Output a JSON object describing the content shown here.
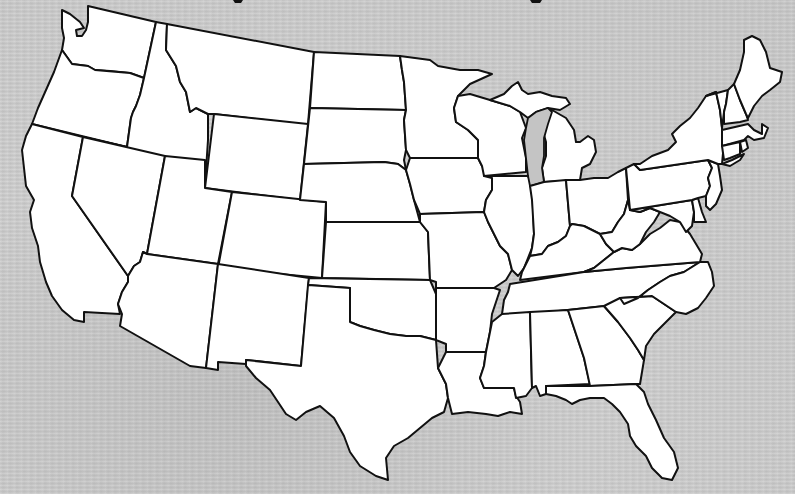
{
  "map": {
    "type": "outline",
    "subject": "Contiguous United States",
    "labels_visible": false,
    "colors": {
      "background": "#cbcbcb",
      "state_fill": "#ffffff",
      "border": "#111111",
      "lake": "#c4c4c4"
    },
    "states": [
      {
        "id": "WA",
        "name": "Washington"
      },
      {
        "id": "OR",
        "name": "Oregon"
      },
      {
        "id": "CA",
        "name": "California"
      },
      {
        "id": "ID",
        "name": "Idaho"
      },
      {
        "id": "NV",
        "name": "Nevada"
      },
      {
        "id": "MT",
        "name": "Montana"
      },
      {
        "id": "WY",
        "name": "Wyoming"
      },
      {
        "id": "UT",
        "name": "Utah"
      },
      {
        "id": "AZ",
        "name": "Arizona"
      },
      {
        "id": "CO",
        "name": "Colorado"
      },
      {
        "id": "NM",
        "name": "New Mexico"
      },
      {
        "id": "ND",
        "name": "North Dakota"
      },
      {
        "id": "SD",
        "name": "South Dakota"
      },
      {
        "id": "NE",
        "name": "Nebraska"
      },
      {
        "id": "KS",
        "name": "Kansas"
      },
      {
        "id": "OK",
        "name": "Oklahoma"
      },
      {
        "id": "TX",
        "name": "Texas"
      },
      {
        "id": "MN",
        "name": "Minnesota"
      },
      {
        "id": "IA",
        "name": "Iowa"
      },
      {
        "id": "MO",
        "name": "Missouri"
      },
      {
        "id": "AR",
        "name": "Arkansas"
      },
      {
        "id": "LA",
        "name": "Louisiana"
      },
      {
        "id": "WI",
        "name": "Wisconsin"
      },
      {
        "id": "IL",
        "name": "Illinois"
      },
      {
        "id": "MI",
        "name": "Michigan"
      },
      {
        "id": "IN",
        "name": "Indiana"
      },
      {
        "id": "OH",
        "name": "Ohio"
      },
      {
        "id": "KY",
        "name": "Kentucky"
      },
      {
        "id": "TN",
        "name": "Tennessee"
      },
      {
        "id": "MS",
        "name": "Mississippi"
      },
      {
        "id": "AL",
        "name": "Alabama"
      },
      {
        "id": "GA",
        "name": "Georgia"
      },
      {
        "id": "FL",
        "name": "Florida"
      },
      {
        "id": "SC",
        "name": "South Carolina"
      },
      {
        "id": "NC",
        "name": "North Carolina"
      },
      {
        "id": "VA",
        "name": "Virginia"
      },
      {
        "id": "WV",
        "name": "West Virginia"
      },
      {
        "id": "PA",
        "name": "Pennsylvania"
      },
      {
        "id": "NY",
        "name": "New York"
      },
      {
        "id": "VT",
        "name": "Vermont"
      },
      {
        "id": "NH",
        "name": "New Hampshire"
      },
      {
        "id": "ME",
        "name": "Maine"
      },
      {
        "id": "MA",
        "name": "Massachusetts"
      },
      {
        "id": "CT",
        "name": "Connecticut"
      },
      {
        "id": "RI",
        "name": "Rhode Island"
      },
      {
        "id": "NJ",
        "name": "New Jersey"
      },
      {
        "id": "DE",
        "name": "Delaware"
      },
      {
        "id": "MD",
        "name": "Maryland"
      }
    ]
  }
}
